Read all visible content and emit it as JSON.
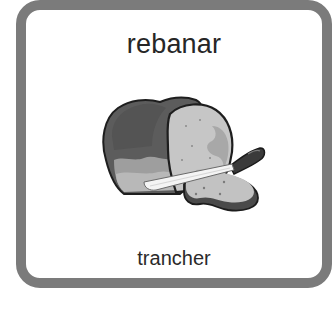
{
  "card": {
    "title": "rebanar",
    "caption": "trancher",
    "illustration": {
      "icon": "sliced-bread-with-knife-icon",
      "description": "Loaf of bread with a slice cut and a knife"
    },
    "colors": {
      "border": "#7b7b7b",
      "background": "#ffffff",
      "text": "#262626",
      "crust_dark": "#5a5a5a",
      "crumb_light": "#c4c4c4",
      "crumb_mid": "#a9a9a9",
      "knife_handle": "#3a3a3a",
      "blade": "#f2f2f2"
    }
  }
}
